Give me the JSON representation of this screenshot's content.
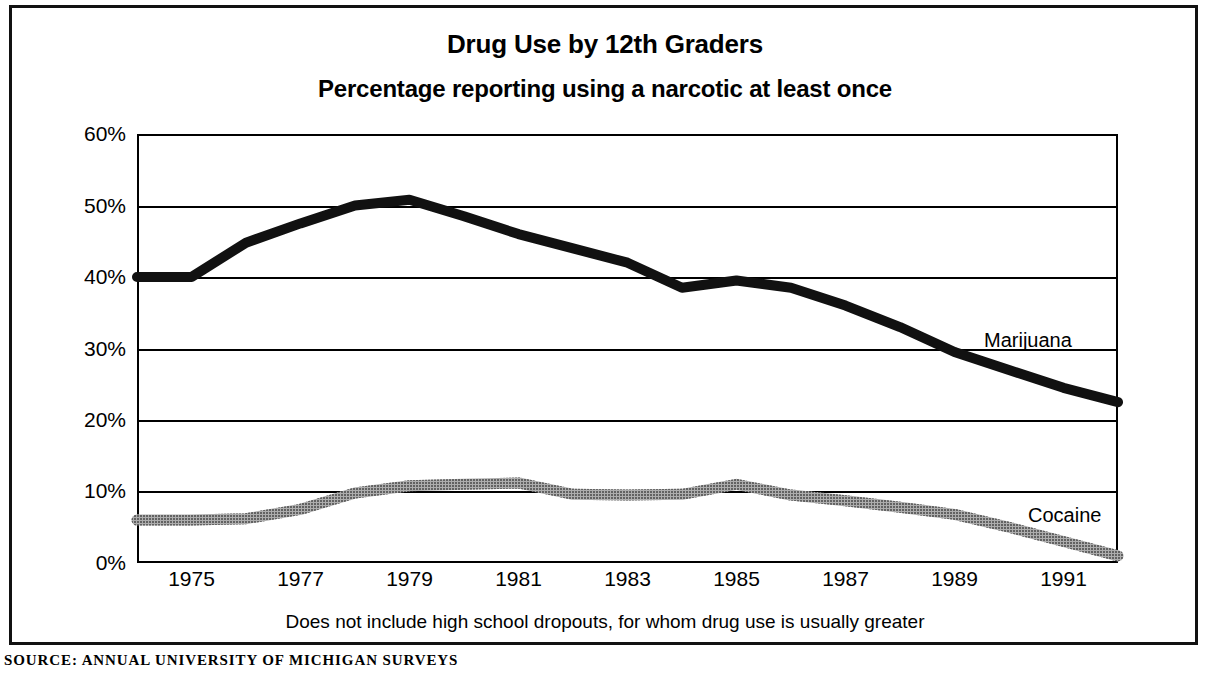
{
  "chart_data": {
    "type": "line",
    "title": "Drug Use by 12th Graders",
    "subtitle": "Percentage reporting using a narcotic at least once",
    "xlabel": "",
    "ylabel": "",
    "footnote": "Does not include high school dropouts, for whom drug use is usually greater",
    "source": "SOURCE: ANNUAL UNIVERSITY OF MICHIGAN SURVEYS",
    "grid": true,
    "legend_position": "inline-right",
    "xlim": [
      1974,
      1992
    ],
    "ylim": [
      0,
      60
    ],
    "ytick_labels": [
      "60%",
      "50%",
      "40%",
      "30%",
      "20%",
      "10%",
      "0%"
    ],
    "ytick_values": [
      60,
      50,
      40,
      30,
      20,
      10,
      0
    ],
    "xtick_labels": [
      "1975",
      "1977",
      "1979",
      "1981",
      "1983",
      "1985",
      "1987",
      "1989",
      "1991"
    ],
    "xtick_values": [
      1975,
      1977,
      1979,
      1981,
      1983,
      1985,
      1987,
      1989,
      1991
    ],
    "x": [
      1974,
      1975,
      1976,
      1977,
      1978,
      1979,
      1980,
      1981,
      1982,
      1983,
      1984,
      1985,
      1986,
      1987,
      1988,
      1989,
      1990,
      1991,
      1992
    ],
    "series": [
      {
        "name": "Marijuana",
        "color": "#111111",
        "style": "solid-thick",
        "values": [
          40.0,
          40.0,
          44.8,
          47.5,
          50.0,
          50.8,
          48.5,
          46.0,
          44.0,
          42.0,
          38.5,
          39.5,
          38.5,
          36.0,
          33.0,
          29.5,
          27.0,
          24.5,
          22.5
        ]
      },
      {
        "name": "Cocaine",
        "color": "#6e6e6e",
        "style": "hatched-thick",
        "values": [
          6.0,
          6.0,
          6.2,
          7.5,
          9.8,
          10.8,
          11.0,
          11.2,
          9.6,
          9.5,
          9.6,
          11.0,
          9.5,
          8.7,
          7.8,
          6.8,
          5.0,
          3.0,
          1.0
        ]
      }
    ],
    "annotations": [
      {
        "text": "Marijuana",
        "x": 1991.2,
        "y": 31.0
      },
      {
        "text": "Cocaine",
        "x": 1992.0,
        "y": 7.0
      }
    ]
  }
}
